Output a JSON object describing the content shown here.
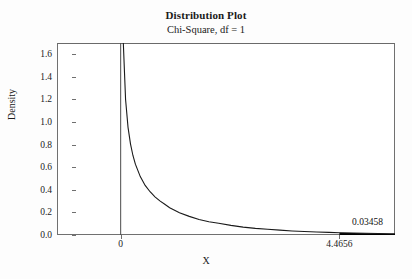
{
  "chart_data": {
    "type": "line",
    "title": "Distribution Plot",
    "subtitle": "Chi-Square, df = 1",
    "xlabel": "X",
    "ylabel": "Density",
    "distribution": "chi-square",
    "df": 1,
    "grid": false,
    "legend": false,
    "xlim": [
      -1.3,
      5.6
    ],
    "ylim": [
      0.0,
      1.7
    ],
    "y_ticks": [
      "1.6",
      "1.4",
      "1.2",
      "1.0",
      "0.8",
      "0.6",
      "0.4",
      "0.2",
      "0.0"
    ],
    "y_tick_values": [
      1.6,
      1.4,
      1.2,
      1.0,
      0.8,
      0.6,
      0.4,
      0.2,
      0.0
    ],
    "x_ticks": [
      "0",
      "4.4656"
    ],
    "x_tick_values": [
      0,
      4.4656
    ],
    "reference_line_x": 0,
    "shaded_region": {
      "from": 4.4656,
      "to": 5.6,
      "label": "0.03458",
      "area": 0.03458,
      "color": "#000000"
    },
    "x": [
      0.05,
      0.1,
      0.15,
      0.2,
      0.25,
      0.3,
      0.4,
      0.5,
      0.6,
      0.7,
      0.8,
      0.9,
      1.0,
      1.2,
      1.4,
      1.6,
      1.8,
      2.0,
      2.25,
      2.5,
      2.75,
      3.0,
      3.25,
      3.5,
      3.75,
      4.0,
      4.25,
      4.4656,
      4.75,
      5.0,
      5.25,
      5.5,
      5.6
    ],
    "y": [
      1.742,
      1.2,
      0.953,
      0.807,
      0.704,
      0.627,
      0.517,
      0.439,
      0.383,
      0.338,
      0.302,
      0.272,
      0.242,
      0.198,
      0.165,
      0.138,
      0.117,
      0.104,
      0.085,
      0.07,
      0.059,
      0.051,
      0.043,
      0.036,
      0.031,
      0.027,
      0.023,
      0.0205,
      0.0175,
      0.015,
      0.013,
      0.0112,
      0.0105
    ],
    "curve_color": "#1a1a1a",
    "frame_color": "#707070"
  }
}
